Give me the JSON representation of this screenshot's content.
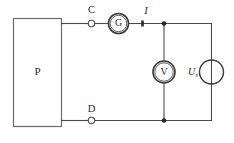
{
  "diagram": {
    "background_color": "#ffffff",
    "line_color": "#4a4a4a"
  },
  "block": {
    "label": "P"
  },
  "terminals": [
    {
      "label": "C",
      "position": "top"
    },
    {
      "label": "D",
      "position": "bottom"
    }
  ],
  "meters": [
    {
      "symbol": "G",
      "name": "galvanometer",
      "branch": "top-series"
    },
    {
      "symbol": "V",
      "name": "voltmeter",
      "branch": "middle-shunt"
    }
  ],
  "source": {
    "symbol": "U",
    "subscript": "s",
    "name": "voltage-source"
  },
  "current": {
    "label": "I"
  },
  "nodes": [
    {
      "name": "top-junction"
    },
    {
      "name": "bottom-junction"
    }
  ]
}
